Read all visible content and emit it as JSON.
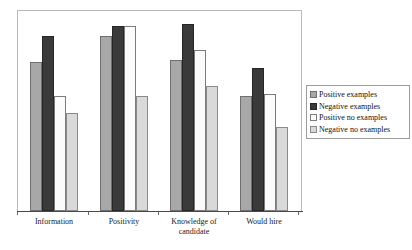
{
  "chart_data": {
    "type": "bar",
    "title": "",
    "subtitle": "",
    "xlabel": "",
    "ylabel": "",
    "ylim": [
      0,
      100
    ],
    "grid": false,
    "legend_position": "right",
    "categories": [
      "Information",
      "Positivity",
      "Knowledge of\ncandidate",
      "Would hire"
    ],
    "category_labels": [
      "Information",
      "Positivity",
      "Knowledge of candidate",
      "Would hire"
    ],
    "series": [
      {
        "name": "Positive examples",
        "color": "#a8a8a8",
        "values": [
          74,
          87,
          75,
          57
        ]
      },
      {
        "name": "Negative examples",
        "color": "#3a3a3a",
        "values": [
          87,
          92,
          93,
          71
        ]
      },
      {
        "name": "Positive no examples",
        "color": "#fbfbfb",
        "values": [
          57,
          92,
          80,
          58
        ]
      },
      {
        "name": "Negative no examples",
        "color": "#d9d9d9",
        "values": [
          49,
          57,
          62,
          42
        ]
      }
    ],
    "legend_entries": [
      "Positive examples",
      "Negative examples",
      "Positive no examples",
      "Negative no examples"
    ]
  }
}
